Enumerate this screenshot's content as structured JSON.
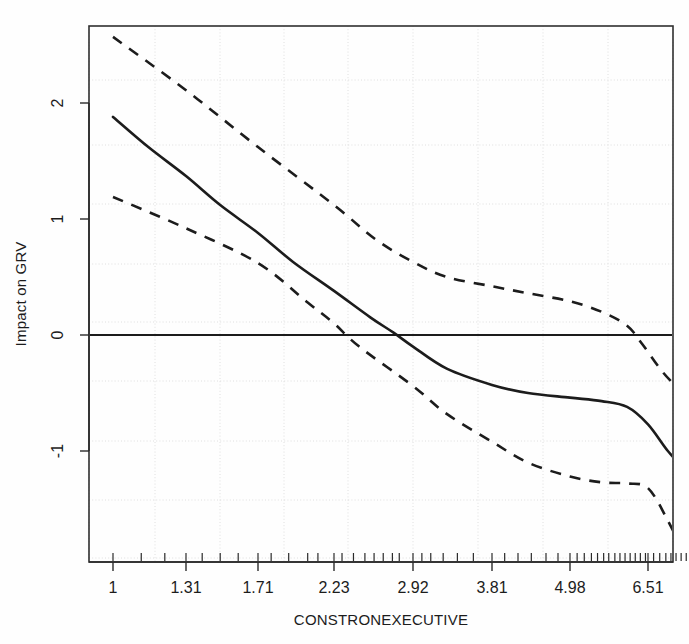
{
  "chart_data": {
    "type": "line",
    "title": "",
    "subtitle": "",
    "xlabel": "CONSTRONEXECUTIVE",
    "ylabel": "Impact on GRV",
    "grid": true,
    "legend": "none",
    "x_tick_labels": [
      "1",
      "1.31",
      "1.71",
      "2.23",
      "2.92",
      "3.81",
      "4.98",
      "6.51"
    ],
    "x_tick_values": [
      1,
      1.31,
      1.71,
      2.23,
      2.92,
      3.81,
      4.98,
      6.51
    ],
    "y_tick_labels": [
      "-1",
      "0",
      "1",
      "2"
    ],
    "y_tick_values": [
      -1,
      0,
      1,
      2
    ],
    "xlim": [
      1.0,
      7.35
    ],
    "ylim": [
      -2.02,
      2.62
    ],
    "x_scale": "log-like (unequal tick spacing)",
    "reference_lines": [
      {
        "name": "zero-reference",
        "orientation": "horizontal",
        "value": 0,
        "style": "solid"
      }
    ],
    "series": [
      {
        "name": "estimated-effect",
        "style": "solid",
        "points": [
          {
            "x": 1.0,
            "y": 1.88
          },
          {
            "x": 1.15,
            "y": 1.62
          },
          {
            "x": 1.31,
            "y": 1.37
          },
          {
            "x": 1.5,
            "y": 1.12
          },
          {
            "x": 1.71,
            "y": 0.88
          },
          {
            "x": 1.95,
            "y": 0.63
          },
          {
            "x": 2.23,
            "y": 0.38
          },
          {
            "x": 2.55,
            "y": 0.15
          },
          {
            "x": 2.75,
            "y": 0.02
          },
          {
            "x": 2.92,
            "y": -0.1
          },
          {
            "x": 3.3,
            "y": -0.29
          },
          {
            "x": 3.81,
            "y": -0.43
          },
          {
            "x": 4.35,
            "y": -0.5
          },
          {
            "x": 4.98,
            "y": -0.54
          },
          {
            "x": 5.6,
            "y": -0.57
          },
          {
            "x": 6.1,
            "y": -0.62
          },
          {
            "x": 6.51,
            "y": -0.77
          },
          {
            "x": 6.9,
            "y": -1.0
          },
          {
            "x": 7.25,
            "y": -1.17
          }
        ]
      },
      {
        "name": "upper-confidence-band",
        "style": "dashed",
        "points": [
          {
            "x": 1.0,
            "y": 2.57
          },
          {
            "x": 1.31,
            "y": 2.11
          },
          {
            "x": 1.71,
            "y": 1.62
          },
          {
            "x": 2.23,
            "y": 1.12
          },
          {
            "x": 2.6,
            "y": 0.82
          },
          {
            "x": 2.92,
            "y": 0.63
          },
          {
            "x": 3.3,
            "y": 0.5
          },
          {
            "x": 3.81,
            "y": 0.42
          },
          {
            "x": 4.35,
            "y": 0.36
          },
          {
            "x": 4.98,
            "y": 0.29
          },
          {
            "x": 5.6,
            "y": 0.2
          },
          {
            "x": 6.1,
            "y": 0.08
          },
          {
            "x": 6.4,
            "y": -0.08
          },
          {
            "x": 6.8,
            "y": -0.32
          },
          {
            "x": 7.25,
            "y": -0.53
          }
        ]
      },
      {
        "name": "lower-confidence-band",
        "style": "dashed",
        "points": [
          {
            "x": 1.0,
            "y": 1.19
          },
          {
            "x": 1.31,
            "y": 0.92
          },
          {
            "x": 1.71,
            "y": 0.62
          },
          {
            "x": 2.05,
            "y": 0.28
          },
          {
            "x": 2.23,
            "y": 0.1
          },
          {
            "x": 2.45,
            "y": -0.1
          },
          {
            "x": 2.92,
            "y": -0.44
          },
          {
            "x": 3.3,
            "y": -0.68
          },
          {
            "x": 3.81,
            "y": -0.92
          },
          {
            "x": 4.35,
            "y": -1.1
          },
          {
            "x": 4.98,
            "y": -1.22
          },
          {
            "x": 5.6,
            "y": -1.27
          },
          {
            "x": 6.1,
            "y": -1.28
          },
          {
            "x": 6.51,
            "y": -1.32
          },
          {
            "x": 6.9,
            "y": -1.6
          },
          {
            "x": 7.25,
            "y": -1.92
          }
        ]
      }
    ],
    "rug_values": [
      1.0,
      1.12,
      1.22,
      1.31,
      1.4,
      1.5,
      1.6,
      1.71,
      1.8,
      1.92,
      2.05,
      2.12,
      2.23,
      2.3,
      2.4,
      2.5,
      2.58,
      2.66,
      2.74,
      2.8,
      2.92,
      3.02,
      3.12,
      3.26,
      3.42,
      3.6,
      3.81,
      4.0,
      4.2,
      4.4,
      4.62,
      4.8,
      4.98,
      5.12,
      5.26,
      5.4,
      5.52,
      5.64,
      5.74,
      5.86,
      5.96,
      6.06,
      6.16,
      6.26,
      6.36,
      6.46,
      6.51,
      6.62,
      6.74,
      6.86,
      6.96,
      7.06,
      7.16,
      7.26
    ]
  },
  "axes": {
    "x_axis_title": "CONSTRONEXECUTIVE",
    "y_axis_title": "Impact on GRV"
  },
  "colors": {
    "line": "#1c1c1c",
    "grid": "#d8d8d8",
    "frame": "#303030",
    "background": "#ffffff"
  }
}
